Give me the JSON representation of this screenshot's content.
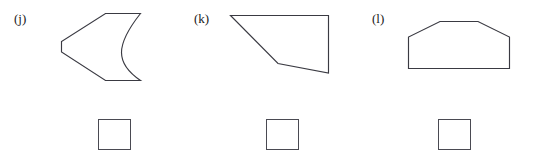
{
  "worksheet": {
    "width": 543,
    "height": 167,
    "background_color": "#ffffff",
    "stroke_color": "#3a3a42",
    "label_color": "#1a1a1a",
    "box_border_color": "#4a4a52"
  },
  "items": [
    {
      "label": "(j)",
      "label_x": 14,
      "label_y": 12,
      "shape_name": "concave-right-pentagon",
      "shape_path": "M 105.5 13.5 L 140.5 13.5 C 129 28 121.5 41 121.5 52.5 C 121.5 64 129.5 73 140.5 80.5 L 105.5 80.5 L 61.5 52 L 61.5 41.5 Z",
      "answer_box": {
        "x": 98,
        "y": 119,
        "width": 33,
        "height": 31
      }
    },
    {
      "label": "(k)",
      "label_x": 194,
      "label_y": 12,
      "shape_name": "notched-quadrilateral",
      "shape_path": "M 230.5 15.5 L 328.5 15.5 L 328.5 73.0 L 278.0 63.5 Z",
      "answer_box": {
        "x": 266,
        "y": 119,
        "width": 33,
        "height": 31
      }
    },
    {
      "label": "(l)",
      "label_x": 372,
      "label_y": 12,
      "shape_name": "symmetric-hexagon",
      "shape_path": "M 408.5 68.5 L 408.5 37.0 L 440.0 21.5 L 478.0 21.5 L 509.5 37.0 L 509.5 68.5 Z",
      "answer_box": {
        "x": 438,
        "y": 119,
        "width": 33,
        "height": 31
      }
    }
  ]
}
